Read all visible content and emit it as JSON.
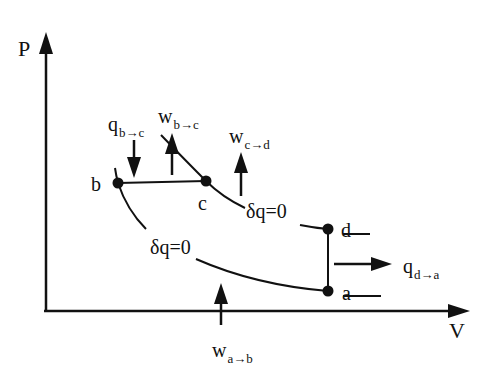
{
  "axes": {
    "y_label": "P",
    "x_label": "V"
  },
  "points": {
    "a": "a",
    "b": "b",
    "c": "c",
    "d": "d"
  },
  "processes": {
    "adiabat_upper": "δq=0",
    "adiabat_lower": "δq=0"
  },
  "arrows": {
    "q_bc": {
      "main": "q",
      "sub": "b→c"
    },
    "w_bc": {
      "main": "w",
      "sub": "b→c"
    },
    "w_cd": {
      "main": "w",
      "sub": "c→d"
    },
    "q_da": {
      "main": "q",
      "sub": "d→a"
    },
    "w_ab": {
      "main": "w",
      "sub": "a→b"
    }
  }
}
